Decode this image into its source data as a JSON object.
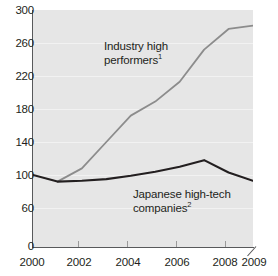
{
  "chart_data": {
    "type": "line",
    "title": "",
    "subtitle": "",
    "xlabel": "",
    "ylabel": "",
    "xlim": [
      2000,
      2009
    ],
    "ylim": [
      0,
      300
    ],
    "grid": true,
    "legend_position": "inline-annotations",
    "x": [
      2000,
      2001,
      2002,
      2003,
      2004,
      2005,
      2006,
      2007,
      2008,
      2009
    ],
    "y_ticks": [
      0,
      60,
      100,
      140,
      180,
      220,
      260,
      300
    ],
    "y_tick_labels": [
      "0",
      "60",
      "100",
      "140",
      "180",
      "220",
      "260",
      "300"
    ],
    "x_ticks": [
      2000,
      2002,
      2004,
      2006,
      2008,
      2009
    ],
    "x_tick_labels": [
      "2000",
      "2002",
      "2004",
      "2006",
      "2008",
      "2009"
    ],
    "series": [
      {
        "name": "Industry high performers",
        "footnote": "1",
        "color": "#8c8c8c",
        "x": [
          2001,
          2002,
          2003,
          2004,
          2005,
          2006,
          2007,
          2008,
          2009
        ],
        "values": [
          92,
          108,
          140,
          172,
          189,
          213,
          252,
          277,
          281
        ]
      },
      {
        "name": "Japanese high-tech companies",
        "footnote": "2",
        "color": "#231f20",
        "x": [
          2000,
          2001,
          2002,
          2003,
          2004,
          2005,
          2006,
          2007,
          2008,
          2009
        ],
        "values": [
          100,
          92,
          93,
          95,
          99,
          104,
          110,
          118,
          103,
          93
        ]
      }
    ],
    "annotations": [
      {
        "id": "industry",
        "line1": "Industry high",
        "line2": "performers",
        "footnote": "1"
      },
      {
        "id": "japanese",
        "line1": "Japanese high-tech",
        "line2": "companies",
        "footnote": "2"
      }
    ]
  },
  "colors": {
    "plot_background": "#e6e6e6",
    "gridline": "#f2f2f2",
    "axis": "#58595b",
    "text": "#231f20",
    "series_grey": "#8c8c8c",
    "series_black": "#231f20",
    "page_background": "#ffffff"
  }
}
